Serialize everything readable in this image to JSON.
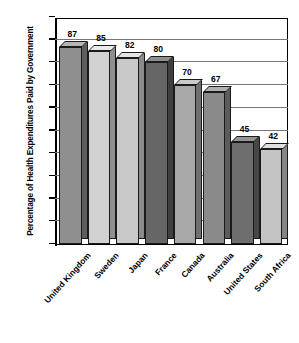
{
  "chart_data": {
    "type": "bar",
    "title": "",
    "subtitle": "",
    "xlabel": "",
    "ylabel": "Percentage of Health Expenditures Paid by Government",
    "ylim": [
      0,
      100
    ],
    "ytick_interval": 10,
    "grid": true,
    "legend": "none",
    "style": "3d-bar-grayscale",
    "categories": [
      "United Kingdom",
      "Sweden",
      "Japan",
      "France",
      "Canada",
      "Australia",
      "United States",
      "South Africa"
    ],
    "values": [
      87,
      85,
      82,
      80,
      70,
      67,
      45,
      42
    ],
    "yticks": [
      0,
      10,
      20,
      30,
      40,
      50,
      60,
      70,
      80,
      90,
      100
    ],
    "bar_colors": [
      "#8f8f8f",
      "#d2d2d2",
      "#c9c9c9",
      "#666666",
      "#a8a8a8",
      "#8a8a8a",
      "#6e6e6e",
      "#c4c4c4"
    ],
    "bar_top_colors": [
      "#b5b5b5",
      "#eaeaea",
      "#e4e4e4",
      "#8e8e8e",
      "#cacaca",
      "#b0b0b0",
      "#949494",
      "#e0e0e0"
    ],
    "bar_side_colors": [
      "#5e5e5e",
      "#8f8f8f",
      "#8a8a8a",
      "#3f3f3f",
      "#6f6f6f",
      "#5c5c5c",
      "#474747",
      "#868686"
    ]
  }
}
